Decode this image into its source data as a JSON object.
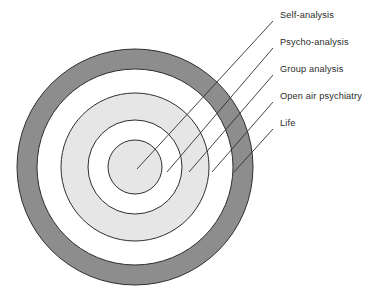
{
  "figure": {
    "type": "concentric-circles-diagram",
    "background_color": "#ffffff",
    "center": {
      "x": 135,
      "y": 167
    },
    "rings": [
      {
        "name": "life-ring",
        "label": "Life",
        "outer_radius": 118,
        "inner_radius": 98,
        "fill": "#8d8d8d",
        "stroke": "#2e2e2e"
      },
      {
        "name": "open-air-psychiatry-ring",
        "label": "Open air psychiatry",
        "outer_radius": 98,
        "inner_radius": 74,
        "fill": "#ffffff",
        "stroke": "#2e2e2e"
      },
      {
        "name": "group-analysis-ring",
        "label": "Group analysis",
        "outer_radius": 74,
        "inner_radius": 47,
        "fill": "#e6e6e6",
        "stroke": "#2e2e2e"
      },
      {
        "name": "psycho-analysis-ring",
        "label": "Psycho-analysis",
        "outer_radius": 47,
        "inner_radius": 27,
        "fill": "#ffffff",
        "stroke": "#2e2e2e"
      },
      {
        "name": "self-analysis-core",
        "label": "Self-analysis",
        "outer_radius": 27,
        "inner_radius": 0,
        "fill": "#e6e6e6",
        "stroke": "#2e2e2e"
      }
    ],
    "labels": [
      {
        "id": "self-analysis",
        "text": "Self-analysis",
        "text_x": 280,
        "text_y": 17,
        "leader": {
          "x1": 273,
          "y1": 21,
          "x2": 137,
          "y2": 169
        }
      },
      {
        "id": "psycho-analysis",
        "text": "Psycho-analysis",
        "text_x": 280,
        "text_y": 44,
        "leader": {
          "x1": 273,
          "y1": 48,
          "x2": 167,
          "y2": 172
        }
      },
      {
        "id": "group-analysis",
        "text": "Group analysis",
        "text_x": 280,
        "text_y": 71,
        "leader": {
          "x1": 273,
          "y1": 75,
          "x2": 189,
          "y2": 172
        }
      },
      {
        "id": "open-air-psychiatry",
        "text": "Open air psychiatry",
        "text_x": 280,
        "text_y": 98,
        "leader": {
          "x1": 273,
          "y1": 102,
          "x2": 212,
          "y2": 172
        }
      },
      {
        "id": "life",
        "text": "Life",
        "text_x": 280,
        "text_y": 125,
        "leader": {
          "x1": 273,
          "y1": 129,
          "x2": 234,
          "y2": 172
        }
      }
    ],
    "line_color": "#2e2e2e"
  }
}
